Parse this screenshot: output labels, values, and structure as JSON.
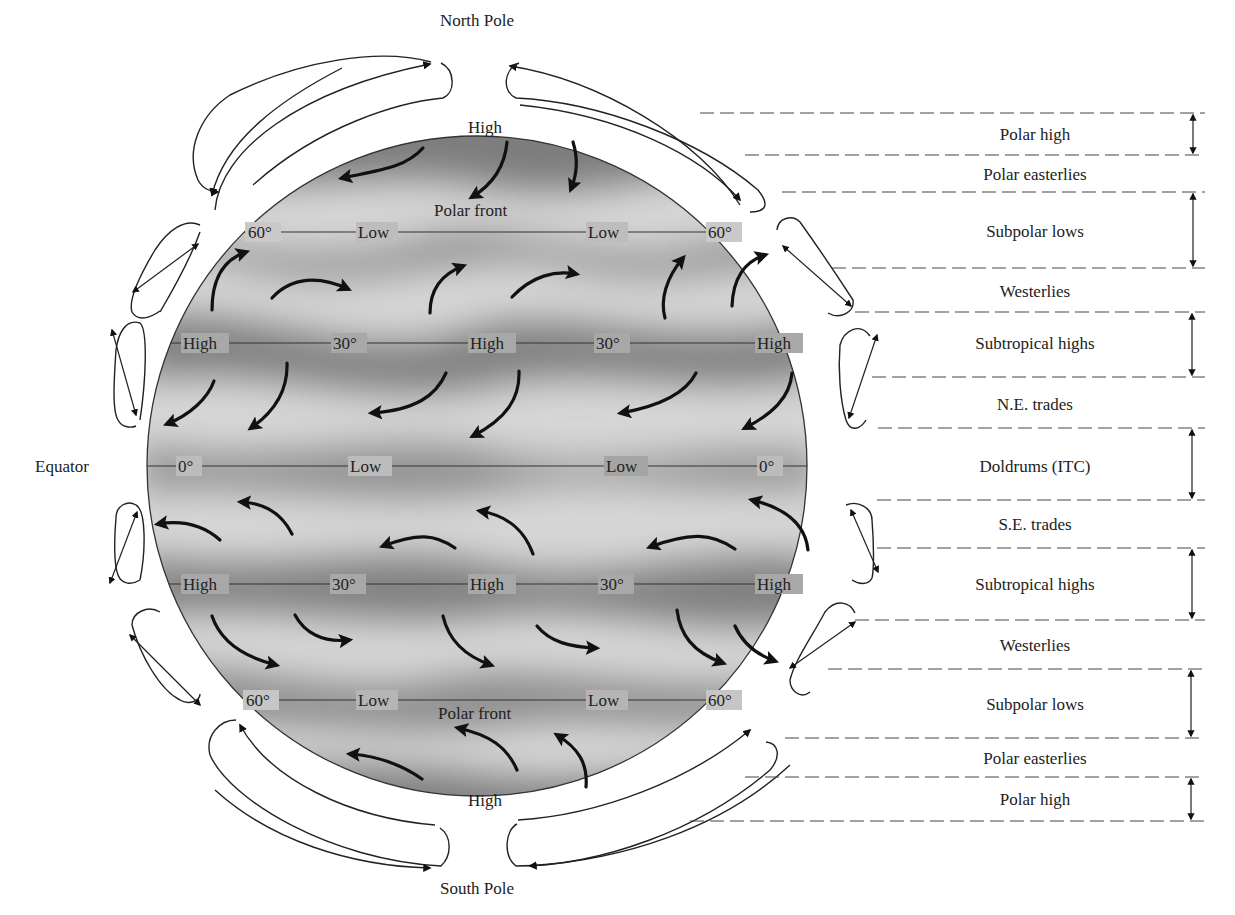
{
  "figure": {
    "title_visible": false,
    "poles": {
      "north": "North Pole",
      "south": "South Pole"
    },
    "equator_label": "Equator",
    "globe": {
      "latitude_lines": [
        {
          "name": "60N",
          "y": 232,
          "labels": [
            "60°",
            "Low",
            "Low",
            "60°"
          ],
          "label_x": [
            262,
            378,
            608,
            722
          ]
        },
        {
          "name": "30N",
          "y": 343,
          "labels": [
            "High",
            "30°",
            "High",
            "30°",
            "High"
          ],
          "label_x": [
            205,
            347,
            491,
            607,
            779
          ]
        },
        {
          "name": "0",
          "y": 466,
          "labels": [
            "0°",
            "Low",
            "Low",
            "0°"
          ],
          "label_x": [
            190,
            372,
            630,
            768
          ]
        },
        {
          "name": "30S",
          "y": 584,
          "labels": [
            "High",
            "30°",
            "High",
            "30°",
            "High"
          ],
          "label_x": [
            205,
            346,
            491,
            612,
            779
          ]
        },
        {
          "name": "60S",
          "y": 700,
          "labels": [
            "60°",
            "Low",
            "Low",
            "60°"
          ],
          "label_x": [
            260,
            378,
            608,
            722
          ]
        }
      ],
      "pole_pressure": {
        "north_high": "High",
        "south_high": "High"
      },
      "polar_front_north": "Polar front",
      "polar_front_south": "Polar front"
    },
    "bands": [
      {
        "label": "Polar high",
        "kind": "pressure",
        "y_top": 113,
        "y_bottom": 155
      },
      {
        "label": "Polar easterlies",
        "kind": "wind",
        "y_top": 155,
        "y_bottom": 192
      },
      {
        "label": "Subpolar lows",
        "kind": "pressure",
        "y_top": 192,
        "y_bottom": 268
      },
      {
        "label": "Westerlies",
        "kind": "wind",
        "y_top": 268,
        "y_bottom": 312
      },
      {
        "label": "Subtropical highs",
        "kind": "pressure",
        "y_top": 312,
        "y_bottom": 377
      },
      {
        "label": "N.E. trades",
        "kind": "wind",
        "y_top": 377,
        "y_bottom": 428
      },
      {
        "label": "Doldrums (ITC)",
        "kind": "pressure",
        "y_top": 428,
        "y_bottom": 500
      },
      {
        "label": "S.E. trades",
        "kind": "wind",
        "y_top": 500,
        "y_bottom": 548
      },
      {
        "label": "Subtropical highs",
        "kind": "pressure",
        "y_top": 548,
        "y_bottom": 620
      },
      {
        "label": "Westerlies",
        "kind": "wind",
        "y_top": 620,
        "y_bottom": 669
      },
      {
        "label": "Subpolar lows",
        "kind": "pressure",
        "y_top": 669,
        "y_bottom": 738
      },
      {
        "label": "Polar easterlies",
        "kind": "wind",
        "y_top": 738,
        "y_bottom": 777
      },
      {
        "label": "Polar high",
        "kind": "pressure",
        "y_top": 777,
        "y_bottom": 821
      }
    ]
  }
}
